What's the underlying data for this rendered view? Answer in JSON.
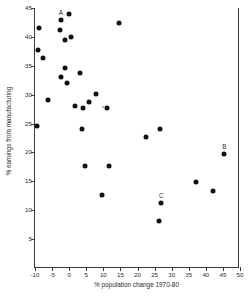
{
  "chart_data": {
    "type": "scatter",
    "title": "",
    "xlabel": "% population change 1970-80",
    "ylabel": "% earnings from manufacturing",
    "xlim": [
      -10,
      50
    ],
    "ylim": [
      0,
      45
    ],
    "xticks": [
      -10,
      -5,
      0,
      5,
      10,
      15,
      20,
      25,
      30,
      35,
      40,
      45,
      50
    ],
    "xtick_labels": [
      "-10",
      "-5",
      "0",
      "5",
      "10",
      "15",
      "20",
      "25",
      "30",
      "35",
      "40",
      "45",
      "50"
    ],
    "yticks": [
      5,
      10,
      15,
      20,
      25,
      30,
      35,
      40,
      45
    ],
    "ytick_labels": [
      "5",
      "10",
      "15",
      "20",
      "25",
      "30",
      "35",
      "40",
      "45"
    ],
    "grid": false,
    "legend": "none",
    "marker": "filled-circle",
    "marker_color": "#111111",
    "axis_color": "#3a3a3a",
    "points": [
      {
        "x": -8.9,
        "y": 41.5,
        "label": ""
      },
      {
        "x": -9.2,
        "y": 37.8,
        "label": ""
      },
      {
        "x": -7.6,
        "y": 36.4,
        "label": ""
      },
      {
        "x": -9.3,
        "y": 24.5,
        "label": ""
      },
      {
        "x": -6.3,
        "y": 29.1,
        "label": ""
      },
      {
        "x": -2.4,
        "y": 43.0,
        "label": "A"
      },
      {
        "x": -0.1,
        "y": 44.0,
        "label": ""
      },
      {
        "x": -2.6,
        "y": 41.2,
        "label": ""
      },
      {
        "x": -1.3,
        "y": 39.5,
        "label": ""
      },
      {
        "x": 0.4,
        "y": 39.9,
        "label": ""
      },
      {
        "x": -2.4,
        "y": 33.0,
        "label": ""
      },
      {
        "x": -1.1,
        "y": 34.6,
        "label": ""
      },
      {
        "x": -0.6,
        "y": 32.1,
        "label": ""
      },
      {
        "x": 3.3,
        "y": 33.7,
        "label": ""
      },
      {
        "x": 1.6,
        "y": 28.1,
        "label": ""
      },
      {
        "x": 4.0,
        "y": 27.7,
        "label": ""
      },
      {
        "x": 5.9,
        "y": 28.8,
        "label": ""
      },
      {
        "x": 7.9,
        "y": 30.1,
        "label": ""
      },
      {
        "x": 11.0,
        "y": 27.7,
        "label": ""
      },
      {
        "x": 3.8,
        "y": 24.0,
        "label": ""
      },
      {
        "x": 14.5,
        "y": 42.4,
        "label": ""
      },
      {
        "x": 4.5,
        "y": 17.6,
        "label": ""
      },
      {
        "x": 9.6,
        "y": 12.6,
        "label": ""
      },
      {
        "x": 11.6,
        "y": 17.7,
        "label": ""
      },
      {
        "x": 22.4,
        "y": 22.6,
        "label": ""
      },
      {
        "x": 26.5,
        "y": 24.1,
        "label": ""
      },
      {
        "x": 27.0,
        "y": 11.2,
        "label": "C"
      },
      {
        "x": 26.4,
        "y": 8.1,
        "label": ""
      },
      {
        "x": 37.1,
        "y": 14.8,
        "label": ""
      },
      {
        "x": 42.0,
        "y": 13.3,
        "label": ""
      },
      {
        "x": 45.4,
        "y": 19.7,
        "label": "B"
      },
      {
        "x": 9.9,
        "y": 27.9,
        "label": "",
        "faint": true
      }
    ]
  }
}
